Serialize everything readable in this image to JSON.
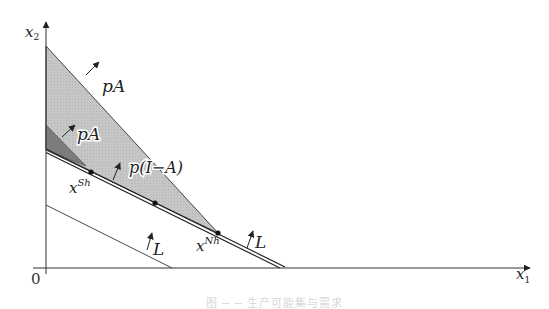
{
  "figure": {
    "axes": {
      "x_label": "x",
      "x_sub": "1",
      "y_label": "x",
      "y_sub": "2",
      "origin_label": "0"
    },
    "regions": [
      {
        "name": "pA-large",
        "label": "pA",
        "fill": "#c4c4c4"
      },
      {
        "name": "pA-small",
        "label": "pA",
        "fill": "#7a7a7a"
      },
      {
        "name": "p-I-minus-A",
        "label": "p(I−A)"
      }
    ],
    "lines": [
      {
        "name": "labor-constraint-upper",
        "label": "L"
      },
      {
        "name": "labor-constraint-lower",
        "label": "L"
      }
    ],
    "points": [
      {
        "name": "x-sh",
        "label": "x",
        "sup": "Sh"
      },
      {
        "name": "x-nh",
        "label": "x",
        "sup": "Nh"
      }
    ],
    "caption": "图 ─ ─ 生产可能集与需求"
  }
}
